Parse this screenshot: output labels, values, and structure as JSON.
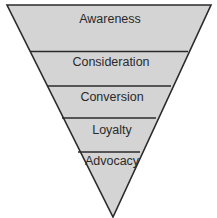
{
  "diagram": {
    "type": "funnel",
    "fill_color": "#d4d4d4",
    "stroke_color": "#2b2b2b",
    "stages": [
      {
        "label": "Awareness"
      },
      {
        "label": "Consideration"
      },
      {
        "label": "Conversion"
      },
      {
        "label": "Loyalty"
      },
      {
        "label": "Advocacy"
      }
    ]
  }
}
